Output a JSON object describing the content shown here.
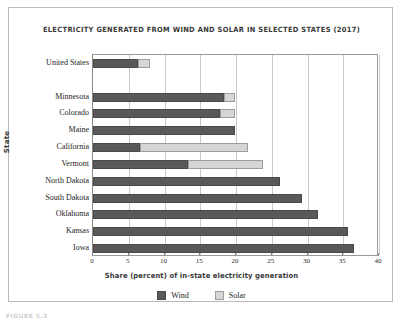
{
  "figure": {
    "caption": "FIGURE 5.3"
  },
  "legend": {
    "position": "bottom-center",
    "entries": [
      {
        "label": "Wind",
        "color": "#595959",
        "icon": "legend-swatch-wind"
      },
      {
        "label": "Solar",
        "color": "#d6d6d6",
        "icon": "legend-swatch-solar"
      }
    ]
  },
  "chart_data": {
    "type": "bar",
    "orientation": "horizontal",
    "stacked": true,
    "title": "ELECTRICITY GENERATED FROM WIND AND SOLAR IN SELECTED STATES (2017)",
    "xlabel": "Share (percent) of in-state electricity generation",
    "ylabel": "State",
    "xlim": [
      0,
      40
    ],
    "xticks": [
      0,
      5,
      10,
      15,
      20,
      25,
      30,
      35,
      40
    ],
    "grid": "vertical",
    "categories": [
      "United States",
      "",
      "Minnesota",
      "Colorado",
      "Maine",
      "California",
      "Vermont",
      "North Dakota",
      "South Dakota",
      "Oklahoma",
      "Kansas",
      "Iowa"
    ],
    "series": [
      {
        "name": "Wind",
        "color": "#595959",
        "values": [
          6.3,
          null,
          18.3,
          17.8,
          19.9,
          6.6,
          13.3,
          26.2,
          29.2,
          31.5,
          35.7,
          36.5
        ]
      },
      {
        "name": "Solar",
        "color": "#d6d6d6",
        "values": [
          1.7,
          null,
          1.6,
          2.1,
          0,
          15.1,
          10.5,
          0,
          0,
          0,
          0,
          0
        ]
      }
    ],
    "totals": [
      8.0,
      null,
      19.9,
      19.9,
      19.9,
      21.7,
      23.8,
      26.2,
      29.2,
      31.5,
      35.7,
      36.5
    ]
  }
}
